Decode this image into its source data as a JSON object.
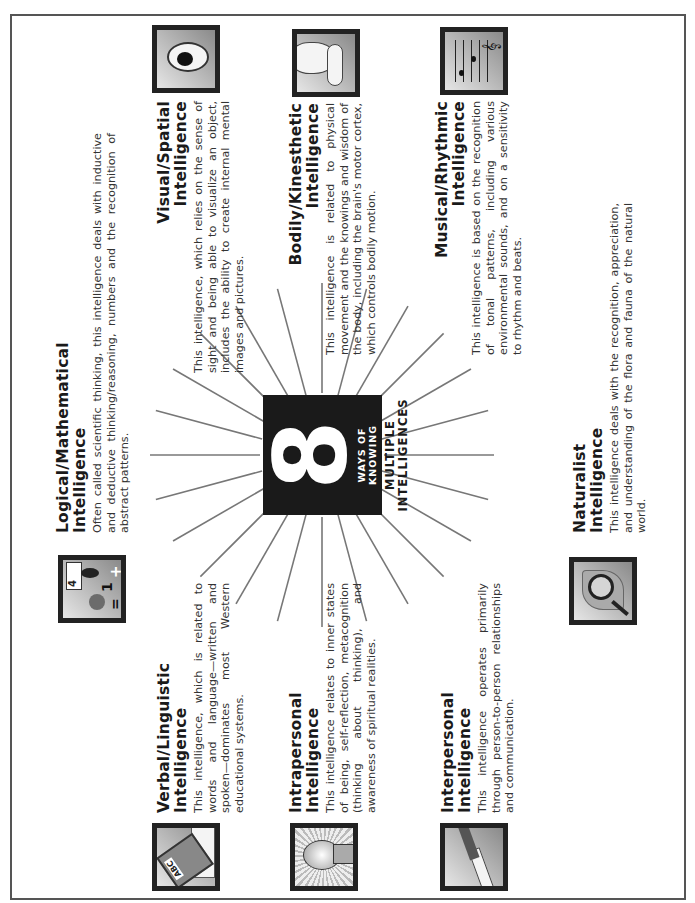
{
  "center": {
    "number": "8",
    "subtitle": "WAYS OF KNOWING",
    "title_line1": "MULTIPLE",
    "title_line2": "INTELLIGENCES"
  },
  "intelligences": [
    {
      "id": "logical-mathematical",
      "title_line1": "Logical/Mathematical",
      "title_line2": "Intelligence",
      "description": "Often called scientific thinking, this intelligence deals with inductive and deductive thinking/reasoning, numbers and the recognition of abstract patterns.",
      "icon": "math-symbols-icon"
    },
    {
      "id": "visual-spatial",
      "title_line1": "Visual/Spatial",
      "title_line2": "Intelligence",
      "description": "This intelligence, which relies on the sense of sight and being able to visualize an object, includes the ability to create internal mental images and pictures.",
      "icon": "eye-icon"
    },
    {
      "id": "bodily-kinesthetic",
      "title_line1": "Bodily/Kinesthetic",
      "title_line2": "Intelligence",
      "description": "This intelligence is related to physical movement and the knowings and wisdom of the body, including the brain's motor cortex, which controls bodily motion.",
      "icon": "flexed-arm-icon"
    },
    {
      "id": "musical-rhythmic",
      "title_line1": "Musical/Rhythmic",
      "title_line2": "Intelligence",
      "description": "This intelligence is based on the recognition of tonal patterns, including various environmental sounds, and on a sensitivity to rhythm and beats.",
      "icon": "music-notes-icon"
    },
    {
      "id": "naturalist",
      "title_line1": "Naturalist",
      "title_line2": "Intelligence",
      "description": "This intelligence deals with the recognition, appreciation, and understanding of the flora and fauna of the natural world.",
      "icon": "magnifier-leaf-icon"
    },
    {
      "id": "interpersonal",
      "title_line1": "Interpersonal",
      "title_line2": "Intelligence",
      "description": "This intelligence operates primarily through person-to-person relationships and communication.",
      "icon": "handshake-icon"
    },
    {
      "id": "intrapersonal",
      "title_line1": "Intrapersonal",
      "title_line2": "Intelligence",
      "description": "This intelligence relates to inner states of being, self-reflection, metacognition (thinking about thinking), and awareness of spiritual realities.",
      "icon": "head-silhouette-icon"
    },
    {
      "id": "verbal-linguistic",
      "title_line1": "Verbal/Linguistic",
      "title_line2": "Intelligence",
      "description": "This intelligence, which is related to words and language—written and spoken—dominates most Western educational systems.",
      "icon": "abc-book-icon",
      "icon_text": "ABC"
    }
  ],
  "math_icon": {
    "digit_top": "4",
    "digit_mid": "1",
    "symbol_eq": "=",
    "symbol_plus": "+"
  }
}
